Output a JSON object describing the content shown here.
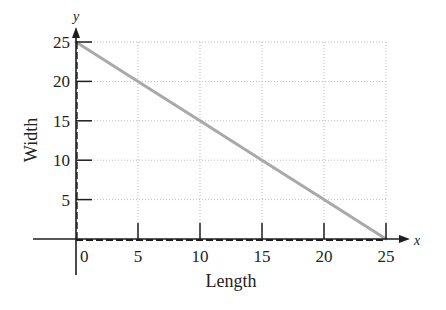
{
  "chart_data": {
    "type": "line",
    "title": "",
    "xlabel": "Length",
    "ylabel": "Width",
    "x_axis_var": "x",
    "y_axis_var": "y",
    "xlim": [
      0,
      25
    ],
    "ylim": [
      0,
      25
    ],
    "x_ticks": [
      0,
      5,
      10,
      15,
      20,
      25
    ],
    "y_ticks": [
      5,
      10,
      15,
      20,
      25
    ],
    "x_tick_labels": [
      "0",
      "5",
      "10",
      "15",
      "20",
      "25"
    ],
    "y_tick_labels": [
      "5",
      "10",
      "15",
      "20",
      "25"
    ],
    "grid": true,
    "legend": null,
    "series": [
      {
        "name": "Width vs Length",
        "x": [
          0,
          5,
          10,
          15,
          20,
          25
        ],
        "y": [
          25,
          20,
          15,
          10,
          5,
          0
        ],
        "color": "#a9a9a9"
      }
    ]
  },
  "colors": {
    "axis": "#1e1e1e",
    "grid": "#bdbdbd",
    "line": "#a9a9a9"
  }
}
